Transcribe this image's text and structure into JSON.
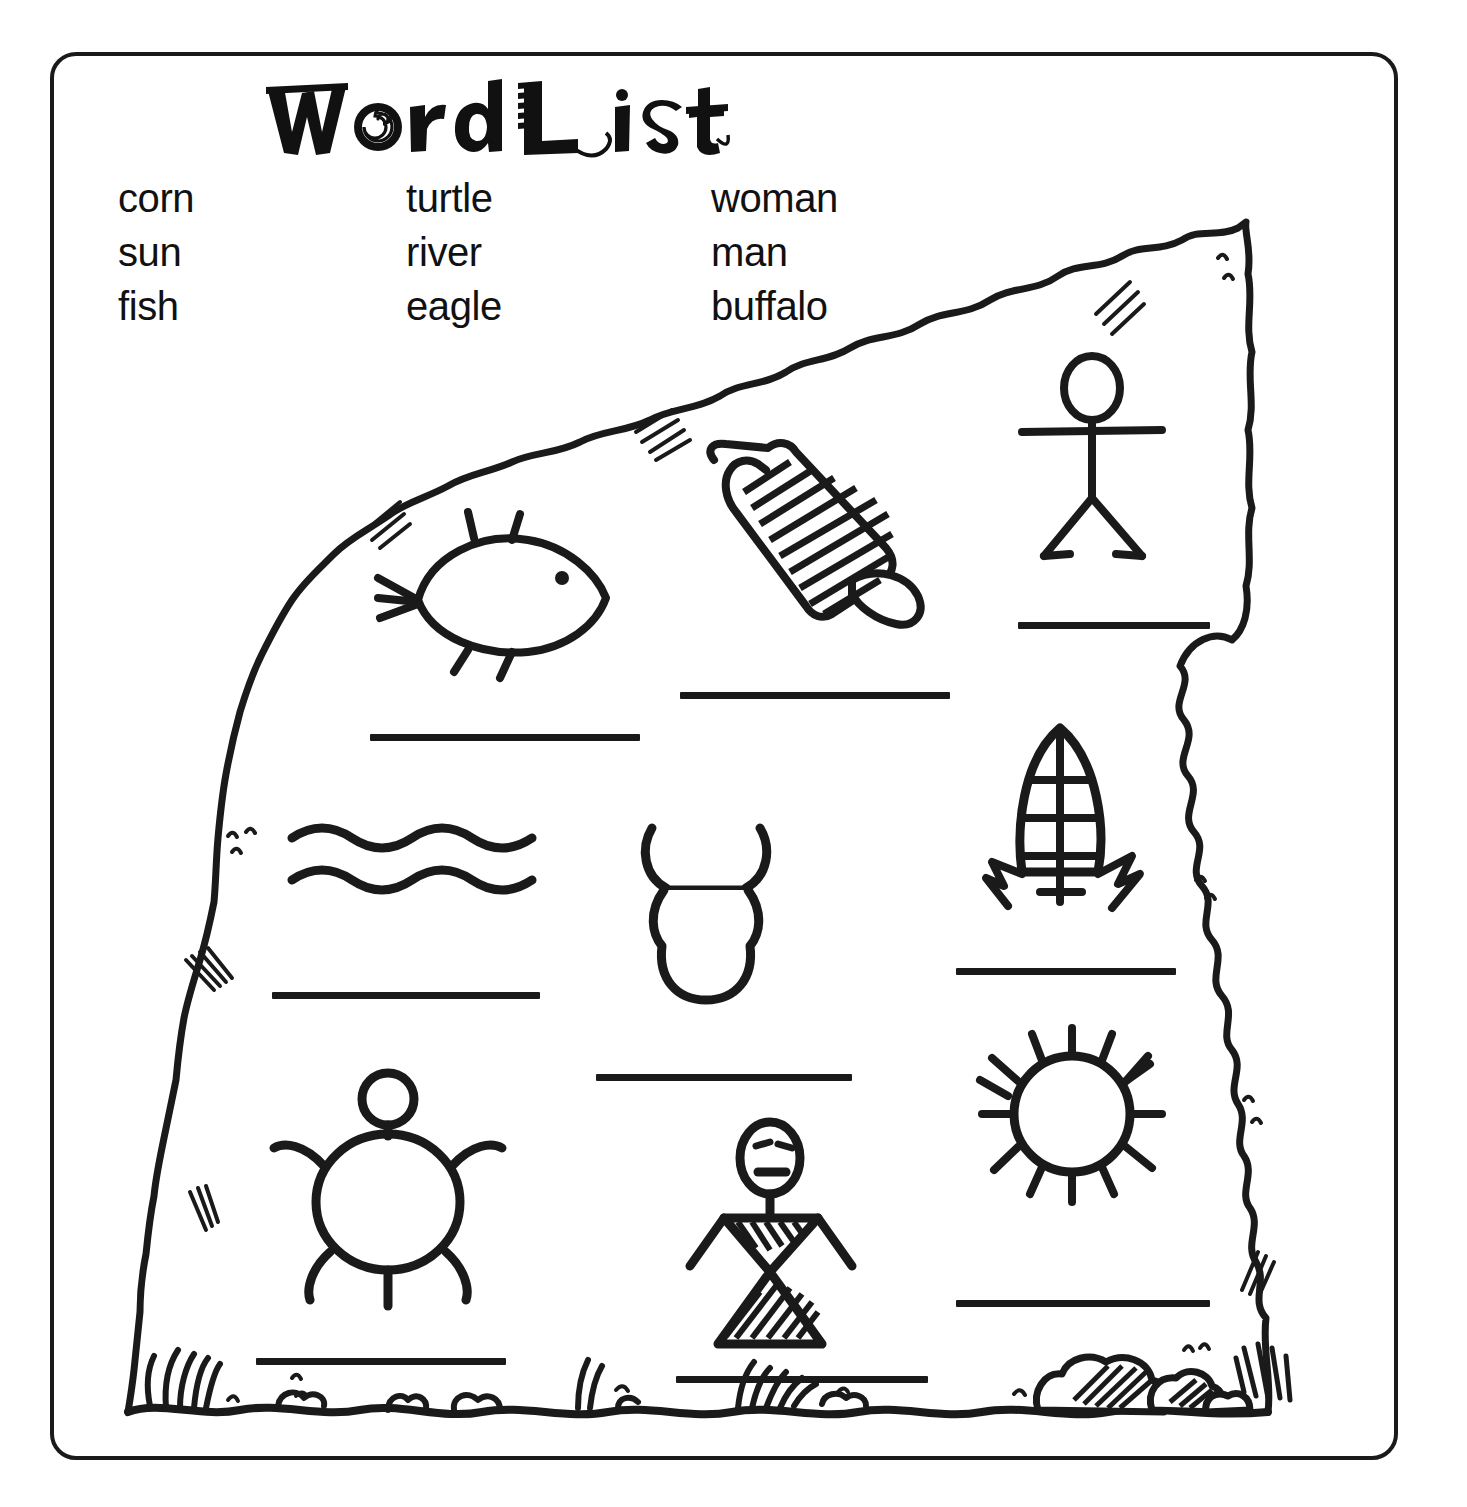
{
  "worksheet": {
    "title": "Word List",
    "title_letters": [
      "W",
      "o",
      "r",
      "d",
      "L",
      "i",
      "s",
      "t"
    ]
  },
  "word_list": {
    "columns": [
      {
        "words": [
          "corn",
          "sun",
          "fish"
        ]
      },
      {
        "words": [
          "turtle",
          "river",
          "eagle"
        ]
      },
      {
        "words": [
          "woman",
          "man",
          "buffalo"
        ]
      }
    ],
    "rows": [
      [
        "corn",
        "turtle",
        "woman"
      ],
      [
        "sun",
        "river",
        "man"
      ],
      [
        "fish",
        "eagle",
        "buffalo"
      ]
    ]
  },
  "rock": {
    "label": "petroglyph-rock",
    "ground_label": "ground-line"
  },
  "pictographs": [
    {
      "id": "fish",
      "icon": "fish-icon",
      "row": 1,
      "col": 1,
      "answer_blank": "blank-fish"
    },
    {
      "id": "eagle",
      "icon": "eagle-icon",
      "row": 1,
      "col": 2,
      "answer_blank": "blank-eagle"
    },
    {
      "id": "man",
      "icon": "stick-figure-icon",
      "row": 1,
      "col": 3,
      "answer_blank": "blank-man"
    },
    {
      "id": "river",
      "icon": "wavy-water-icon",
      "row": 2,
      "col": 1,
      "answer_blank": "blank-river"
    },
    {
      "id": "buffalo",
      "icon": "buffalo-head-icon",
      "row": 2,
      "col": 2,
      "answer_blank": "blank-buffalo"
    },
    {
      "id": "corn",
      "icon": "corn-cob-icon",
      "row": 2,
      "col": 3,
      "answer_blank": "blank-corn"
    },
    {
      "id": "turtle",
      "icon": "turtle-icon",
      "row": 3,
      "col": 1,
      "answer_blank": "blank-turtle"
    },
    {
      "id": "woman",
      "icon": "woman-figure-icon",
      "row": 3,
      "col": 2,
      "answer_blank": "blank-woman"
    },
    {
      "id": "sun",
      "icon": "sun-icon",
      "row": 3,
      "col": 3,
      "answer_blank": "blank-sun"
    }
  ],
  "answer_blanks": [
    {
      "name": "blank-fish",
      "value": ""
    },
    {
      "name": "blank-eagle",
      "value": ""
    },
    {
      "name": "blank-man",
      "value": ""
    },
    {
      "name": "blank-river",
      "value": ""
    },
    {
      "name": "blank-buffalo",
      "value": ""
    },
    {
      "name": "blank-corn",
      "value": ""
    },
    {
      "name": "blank-turtle",
      "value": ""
    },
    {
      "name": "blank-woman",
      "value": ""
    },
    {
      "name": "blank-sun",
      "value": ""
    }
  ],
  "colors": {
    "ink": "#1a1a1a",
    "paper": "#ffffff",
    "text": "#111111"
  }
}
